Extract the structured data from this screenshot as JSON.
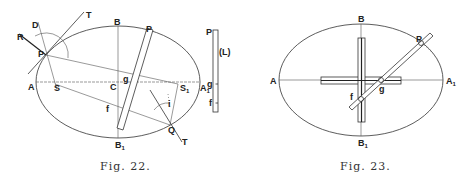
{
  "figures": [
    {
      "id": "fig22",
      "caption": "Fig. 22.",
      "labels": {
        "D": "D",
        "T_top": "T",
        "R": "R",
        "P": "P",
        "B": "B",
        "P_rod": "P",
        "A": "A",
        "S": "S",
        "C": "C",
        "g": "g",
        "S1": "S",
        "S1_sub": "1",
        "A1": "A",
        "A1_sub": "1",
        "f": "f",
        "Q": "Q",
        "T_bottom": "T",
        "B1": "B",
        "B1_sub": "1",
        "i": "i"
      },
      "strip": {
        "P": "P",
        "L": "(L)",
        "g": "g",
        "f": "f"
      }
    },
    {
      "id": "fig23",
      "caption": "Fig. 23.",
      "labels": {
        "B": "B",
        "P": "P",
        "A": "A",
        "A1": "A",
        "A1_sub": "1",
        "g": "g",
        "f": "f",
        "B1": "B",
        "B1_sub": "1"
      }
    }
  ]
}
